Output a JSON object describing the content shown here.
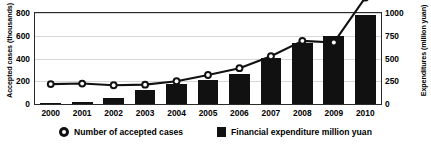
{
  "chart_data": {
    "type": "bar",
    "title": "",
    "subtitle": "",
    "xlabel": "",
    "ylabel": "Accepted cases (thousands)",
    "y2label": "Expenditures (million yuan)",
    "grid": true,
    "legend_position": "bottom",
    "categories": [
      "2000",
      "2001",
      "2002",
      "2003",
      "2004",
      "2005",
      "2006",
      "2007",
      "2008",
      "2009",
      "2010"
    ],
    "ylim": [
      0,
      800
    ],
    "yticks": [
      "0",
      "200",
      "400",
      "600",
      "800"
    ],
    "ytick_values": [
      0,
      200,
      400,
      600,
      800
    ],
    "y2lim": [
      0,
      1000
    ],
    "y2ticks": [
      "0",
      "250",
      "500",
      "750",
      "1000"
    ],
    "y2tick_values": [
      0,
      250,
      500,
      750,
      1000
    ],
    "series": [
      {
        "name": "Number of accepted cases",
        "kind": "line",
        "axis": "left",
        "marker": "circle",
        "color": "#111111",
        "values": [
          175,
          180,
          165,
          170,
          200,
          255,
          315,
          420,
          555,
          540,
          935
        ]
      },
      {
        "name": "Financial expenditure million yuan",
        "kind": "bar",
        "axis": "right",
        "color": "#111111",
        "values": [
          5,
          25,
          70,
          150,
          215,
          260,
          335,
          510,
          665,
          750,
          975
        ]
      }
    ]
  },
  "legend": {
    "entries": [
      {
        "label": "Number of accepted cases",
        "marker": "circle-marker-icon"
      },
      {
        "label": "Financial expenditure million yuan",
        "marker": "square-marker-icon"
      }
    ]
  }
}
